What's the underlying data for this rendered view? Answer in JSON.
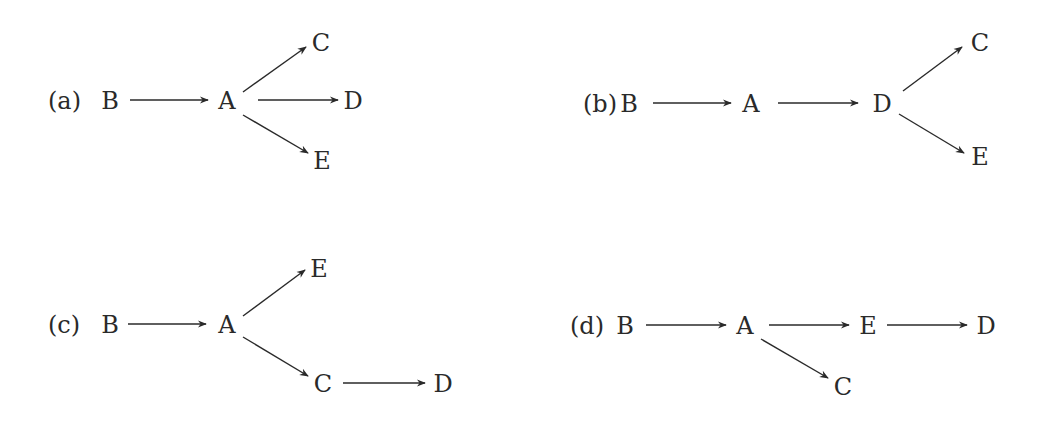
{
  "colors": {
    "ink": "#2a2a2a",
    "background": "#ffffff"
  },
  "panels": [
    {
      "id": "a",
      "label": "(a)",
      "label_pos": [
        48,
        101
      ],
      "nodes": [
        {
          "id": "B",
          "text": "B",
          "x": 110,
          "y": 101
        },
        {
          "id": "A",
          "text": "A",
          "x": 227,
          "y": 101
        },
        {
          "id": "C",
          "text": "C",
          "x": 321,
          "y": 43
        },
        {
          "id": "D",
          "text": "D",
          "x": 353,
          "y": 101
        },
        {
          "id": "E",
          "text": "E",
          "x": 322,
          "y": 161
        }
      ],
      "edges": [
        {
          "from": "B",
          "to": "A",
          "x1": 130,
          "y1": 100,
          "x2": 208,
          "y2": 100
        },
        {
          "from": "A",
          "to": "C",
          "x1": 243,
          "y1": 92,
          "x2": 306,
          "y2": 47
        },
        {
          "from": "A",
          "to": "D",
          "x1": 258,
          "y1": 100,
          "x2": 338,
          "y2": 100
        },
        {
          "from": "A",
          "to": "E",
          "x1": 243,
          "y1": 115,
          "x2": 308,
          "y2": 153
        }
      ]
    },
    {
      "id": "b",
      "label": "(b)",
      "label_pos": [
        583,
        104
      ],
      "nodes": [
        {
          "id": "B",
          "text": "B",
          "x": 629,
          "y": 104
        },
        {
          "id": "A",
          "text": "A",
          "x": 751,
          "y": 104
        },
        {
          "id": "D",
          "text": "D",
          "x": 882,
          "y": 104
        },
        {
          "id": "C",
          "text": "C",
          "x": 980,
          "y": 43
        },
        {
          "id": "E",
          "text": "E",
          "x": 980,
          "y": 157
        }
      ],
      "edges": [
        {
          "from": "B",
          "to": "A",
          "x1": 653,
          "y1": 103,
          "x2": 731,
          "y2": 103
        },
        {
          "from": "A",
          "to": "D",
          "x1": 778,
          "y1": 103,
          "x2": 858,
          "y2": 103
        },
        {
          "from": "D",
          "to": "C",
          "x1": 903,
          "y1": 91,
          "x2": 962,
          "y2": 47
        },
        {
          "from": "D",
          "to": "E",
          "x1": 899,
          "y1": 114,
          "x2": 964,
          "y2": 153
        }
      ]
    },
    {
      "id": "c",
      "label": "(c)",
      "label_pos": [
        48,
        325
      ],
      "nodes": [
        {
          "id": "B",
          "text": "B",
          "x": 110,
          "y": 325
        },
        {
          "id": "A",
          "text": "A",
          "x": 227,
          "y": 325
        },
        {
          "id": "E",
          "text": "E",
          "x": 319,
          "y": 269
        },
        {
          "id": "C",
          "text": "C",
          "x": 323,
          "y": 384
        },
        {
          "id": "D",
          "text": "D",
          "x": 443,
          "y": 384
        }
      ],
      "edges": [
        {
          "from": "B",
          "to": "A",
          "x1": 128,
          "y1": 324,
          "x2": 206,
          "y2": 324
        },
        {
          "from": "A",
          "to": "E",
          "x1": 243,
          "y1": 316,
          "x2": 305,
          "y2": 270
        },
        {
          "from": "A",
          "to": "C",
          "x1": 243,
          "y1": 337,
          "x2": 308,
          "y2": 376
        },
        {
          "from": "C",
          "to": "D",
          "x1": 343,
          "y1": 383,
          "x2": 425,
          "y2": 383
        }
      ]
    },
    {
      "id": "d",
      "label": "(d)",
      "label_pos": [
        570,
        326
      ],
      "nodes": [
        {
          "id": "B",
          "text": "B",
          "x": 625,
          "y": 326
        },
        {
          "id": "A",
          "text": "A",
          "x": 745,
          "y": 326
        },
        {
          "id": "E",
          "text": "E",
          "x": 868,
          "y": 326
        },
        {
          "id": "D",
          "text": "D",
          "x": 986,
          "y": 326
        },
        {
          "id": "C",
          "text": "C",
          "x": 843,
          "y": 387
        }
      ],
      "edges": [
        {
          "from": "B",
          "to": "A",
          "x1": 646,
          "y1": 325,
          "x2": 726,
          "y2": 325
        },
        {
          "from": "A",
          "to": "E",
          "x1": 769,
          "y1": 325,
          "x2": 849,
          "y2": 325
        },
        {
          "from": "E",
          "to": "D",
          "x1": 887,
          "y1": 325,
          "x2": 967,
          "y2": 325
        },
        {
          "from": "A",
          "to": "C",
          "x1": 761,
          "y1": 339,
          "x2": 828,
          "y2": 378
        }
      ]
    }
  ]
}
